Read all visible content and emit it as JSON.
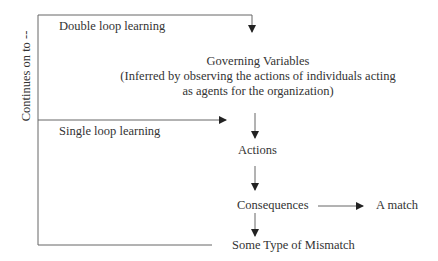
{
  "diagram": {
    "side_label": "Continues on to --",
    "double_loop_label": "Double loop learning",
    "single_loop_label": "Single loop learning",
    "nodes": {
      "governing_title": "Governing Variables",
      "governing_line2": "(Inferred by observing the actions of individuals acting",
      "governing_line3": "as agents for the organization)",
      "actions": "Actions",
      "consequences": "Consequences",
      "match": "A match",
      "mismatch": "Some Type of Mismatch"
    },
    "colors": {
      "line": "#555555",
      "text": "#333333"
    }
  }
}
